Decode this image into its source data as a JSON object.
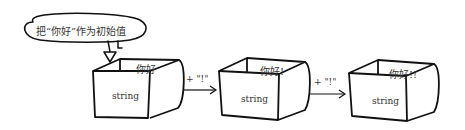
{
  "diagram": {
    "callout": {
      "text": "把“你好”作为初始值"
    },
    "boxes": [
      {
        "type_label": "string",
        "value": "你好"
      },
      {
        "type_label": "string",
        "value": "你好!"
      },
      {
        "type_label": "string",
        "value": "你好!!"
      }
    ],
    "arrows": [
      {
        "label": "+ \"!\""
      },
      {
        "label": "+ \"!\""
      }
    ],
    "colors": {
      "stroke": "#111111",
      "text": "#333333",
      "background": "#ffffff"
    }
  }
}
